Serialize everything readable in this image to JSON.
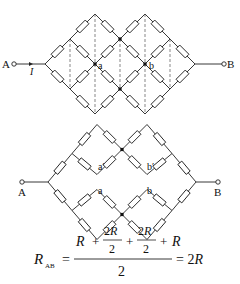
{
  "diagram_top": {
    "terminal_left": "A",
    "terminal_right": "B",
    "current_label": "I",
    "node_labels": [
      "a",
      "b"
    ]
  },
  "diagram_bottom": {
    "terminal_left": "A",
    "terminal_right": "B",
    "node_labels": [
      "a′",
      "a",
      "b′",
      "b"
    ]
  },
  "formula": {
    "lhs": "R",
    "lhs_sub": "AB",
    "equals": "=",
    "numerator": {
      "t1": "R",
      "plus": "+",
      "f1_num": "2R",
      "f1_den": "2",
      "f2_num": "2R",
      "f2_den": "2",
      "t4": "R"
    },
    "denominator": "2",
    "result": "= 2R"
  }
}
